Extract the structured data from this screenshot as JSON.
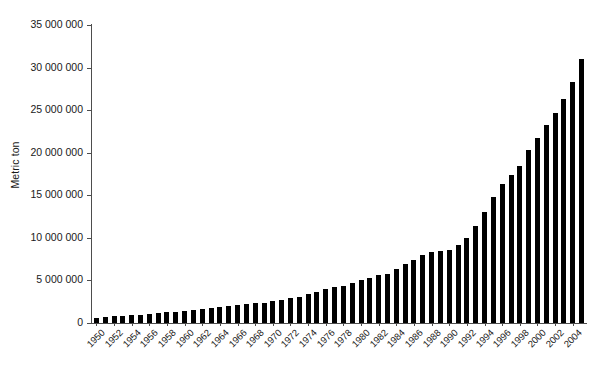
{
  "chart_data": {
    "type": "bar",
    "title": "",
    "subtitle": "",
    "xlabel": "",
    "ylabel": "Metric ton",
    "ylim": [
      0,
      35000000
    ],
    "ytick_values": [
      0,
      5000000,
      10000000,
      15000000,
      20000000,
      25000000,
      30000000,
      35000000
    ],
    "ytick_labels": [
      "0",
      "5 000 000",
      "10 000 000",
      "15 000 000",
      "20 000 000",
      "25 000 000",
      "30 000 000",
      "35 000 000"
    ],
    "grid": false,
    "legend": null,
    "bar_color": "#000000",
    "axis_color": "#4d4d4d",
    "xtick_labels": [
      "1950",
      "1952",
      "1954",
      "1956",
      "1958",
      "1960",
      "1962",
      "1964",
      "1966",
      "1968",
      "1970",
      "1972",
      "1974",
      "1976",
      "1978",
      "1980",
      "1982",
      "1984",
      "1986",
      "1988",
      "1990",
      "1992",
      "1994",
      "1996",
      "1998",
      "2000",
      "2002",
      "2004"
    ],
    "xtick_step_years": 2,
    "categories": [
      "1950",
      "1951",
      "1952",
      "1953",
      "1954",
      "1955",
      "1956",
      "1957",
      "1958",
      "1959",
      "1960",
      "1961",
      "1962",
      "1963",
      "1964",
      "1965",
      "1966",
      "1967",
      "1968",
      "1969",
      "1970",
      "1971",
      "1972",
      "1973",
      "1974",
      "1975",
      "1976",
      "1977",
      "1978",
      "1979",
      "1980",
      "1981",
      "1982",
      "1983",
      "1984",
      "1985",
      "1986",
      "1987",
      "1988",
      "1989",
      "1990",
      "1991",
      "1992",
      "1993",
      "1994",
      "1995",
      "1996",
      "1997",
      "1998",
      "1999",
      "2000",
      "2001",
      "2002",
      "2003",
      "2004",
      "2005"
    ],
    "values": [
      600000,
      700000,
      800000,
      850000,
      900000,
      1000000,
      1100000,
      1150000,
      1250000,
      1350000,
      1450000,
      1550000,
      1650000,
      1750000,
      1900000,
      2000000,
      2100000,
      2250000,
      2350000,
      2400000,
      2600000,
      2700000,
      2900000,
      3100000,
      3400000,
      3700000,
      4000000,
      4200000,
      4400000,
      4700000,
      5000000,
      5300000,
      5600000,
      5800000,
      6300000,
      6900000,
      7400000,
      8000000,
      8300000,
      8400000,
      8600000,
      9200000,
      10000000,
      11400000,
      13000000,
      14800000,
      16300000,
      17400000,
      18500000,
      20300000,
      21700000,
      23300000,
      24700000,
      26300000,
      28300000,
      31000000
    ],
    "value_unit": "Metric ton",
    "source_note": ""
  },
  "axis": {
    "y_title": "Metric ton"
  }
}
